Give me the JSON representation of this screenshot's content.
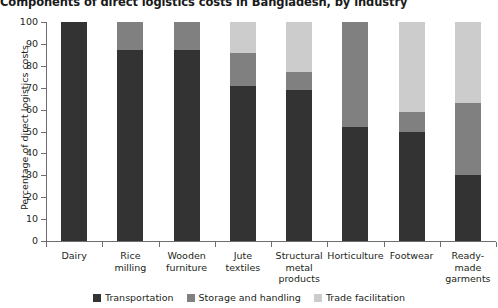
{
  "chart_data": {
    "type": "bar",
    "subtype": "stacked-100-percent",
    "title": "Components of direct logistics costs in Bangladesh, by industry",
    "xlabel": "",
    "ylabel": "Percentage of direct logistics costs",
    "ylim": [
      0,
      100
    ],
    "ytick_step": 10,
    "ytick_labels": [
      "100",
      "90",
      "80",
      "70",
      "60",
      "50",
      "40",
      "30",
      "20",
      "10",
      "0"
    ],
    "grid": false,
    "legend_position": "bottom-center",
    "categories": [
      "Dairy",
      "Rice milling",
      "Wooden furniture",
      "Jute textiles",
      "Structural metal products",
      "Horticulture",
      "Footwear",
      "Ready-made garments"
    ],
    "category_lines": [
      [
        "Dairy"
      ],
      [
        "Rice",
        "milling"
      ],
      [
        "Wooden",
        "furniture"
      ],
      [
        "Jute",
        "textiles"
      ],
      [
        "Structural",
        "metal",
        "products"
      ],
      [
        "Horticulture"
      ],
      [
        "Footwear"
      ],
      [
        "Ready-",
        "made",
        "garments"
      ]
    ],
    "series": [
      {
        "name": "Transportation",
        "color": "#333333",
        "values": [
          100,
          87,
          87,
          71,
          69,
          52,
          50,
          30
        ]
      },
      {
        "name": "Storage and handling",
        "color": "#808080",
        "values": [
          0,
          13,
          13,
          15,
          8,
          48,
          9,
          33
        ]
      },
      {
        "name": "Trade facilitation",
        "color": "#cccccc",
        "values": [
          0,
          0,
          0,
          14,
          23,
          0,
          41,
          37
        ]
      }
    ]
  },
  "colors": {
    "axis": "#6d6e71",
    "text": "#231f20",
    "background": "#ffffff",
    "transportation": "#333333",
    "storage_and_handling": "#808080",
    "trade_facilitation": "#cccccc"
  }
}
